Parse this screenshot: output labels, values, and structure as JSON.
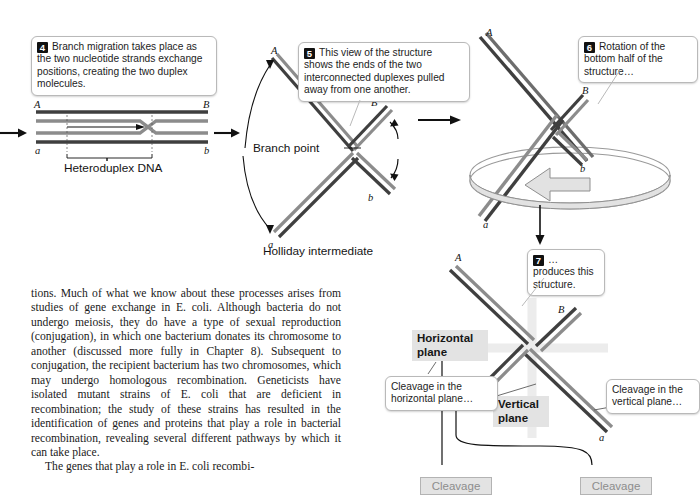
{
  "figure": {
    "callouts": [
      {
        "id": "step4",
        "number": "4",
        "text": "Branch migration takes place as the two nucleotide strands exchange positions, creating the two duplex molecules."
      },
      {
        "id": "step5",
        "number": "5",
        "text": "This view of the structure shows the ends of the two interconnected duplexes pulled away from one another."
      },
      {
        "id": "step6",
        "number": "6",
        "text": "Rotation of the bottom half of the structure…"
      },
      {
        "id": "step7",
        "number": "7",
        "text": "…produces this structure."
      },
      {
        "id": "cleavage-horizontal",
        "number": "",
        "text": "Cleavage in the horizontal plane…"
      },
      {
        "id": "cleavage-vertical",
        "number": "",
        "text": "Cleavage in the vertical plane…"
      }
    ],
    "labels": {
      "heteroduplex": "Heteroduplex DNA",
      "branch_point": "Branch point",
      "holliday_intermediate": "Holliday intermediate",
      "horizontal_plane": "Horizontal\nplane",
      "vertical_plane": "Vertical\nplane",
      "bottom_box_left": "Cleavage",
      "bottom_box_right": "Cleavage"
    },
    "strand_ends": {
      "panel1_top_left": "A",
      "panel1_top_right": "B",
      "panel1_bottom_left": "a",
      "panel1_bottom_right": "b",
      "panel2_top_left": "A",
      "panel2_top_right": "B",
      "panel2_bottom_left": "a",
      "panel2_bottom_right": "b",
      "panel3_top_left": "A",
      "panel3_top_right": "B",
      "panel3_bottom_left": "a",
      "panel3_bottom_right": "b",
      "panel4_top_left": "A",
      "panel4_top_right": "B",
      "panel4_bottom_left": "b",
      "panel4_bottom_right": "a"
    },
    "colors": {
      "strand_dark": "#3f3f3f",
      "strand_light": "#8c8c8c",
      "callout_border": "#b9b9b9",
      "chip_background": "#e3e3e3",
      "number_badge": "#111111",
      "ring_fill": "#d9d9d9",
      "ring_stroke": "#9a9a9a",
      "arrow": "#111111"
    }
  },
  "body_text": {
    "paragraph_1": "tions. Much of what we know about these processes arises from studies of gene exchange in E. coli. Although bacteria do not undergo meiosis, they do have a type of sexual reproduction (conjugation), in which one bacterium donates its chromosome to another (discussed more fully in Chapter 8). Subsequent to conjugation, the recipient bacterium has two chromosomes, which may undergo homologous recombination. Geneticists have isolated mutant strains of E. coli that are deficient in recombination; the study of these strains has resulted in the identification of genes and proteins that play a role in bacterial recombination, revealing several different pathways by which it can take place.",
    "paragraph_2_partial": "The genes that play a role in E. coli recombi-"
  }
}
